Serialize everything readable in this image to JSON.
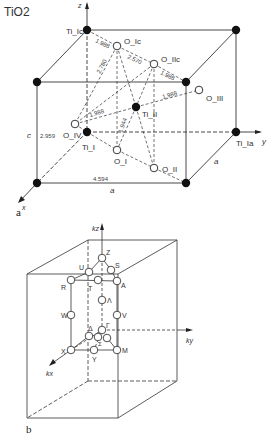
{
  "panel_a": {
    "title": "TiO2",
    "panel_label": "a",
    "axes": {
      "z": "z",
      "y": "y",
      "x": "x"
    },
    "atoms": {
      "Ti_Ic": "Ti_Ic",
      "Ti_Ia": "Ti_Ia",
      "Ti_I": "Ti_I",
      "Ti_II": "Ti_II",
      "O_Ic": "O_Ic",
      "O_IIc": "O_IIc",
      "O_I": "O_I",
      "O_II": "O_II",
      "O_III": "O_III",
      "O_IV": "O_IV"
    },
    "bond_lengths": [
      "1.988",
      "2.780",
      "2.570",
      "1.988",
      "1.988",
      "1.944",
      "1.988"
    ],
    "dimensions": {
      "c_label": "c",
      "c_value": "2.959",
      "a_value": "4.594",
      "a_label": "a",
      "a_side": "a"
    }
  },
  "panel_b": {
    "panel_label": "b",
    "axes": {
      "kz": "kz",
      "ky": "ky",
      "kx": "kx"
    },
    "points": [
      "Z",
      "U",
      "S",
      "R",
      "T",
      "A",
      "Λ",
      "W",
      "V",
      "Δ",
      "Γ",
      "Σ",
      "X",
      "Y",
      "M"
    ]
  }
}
